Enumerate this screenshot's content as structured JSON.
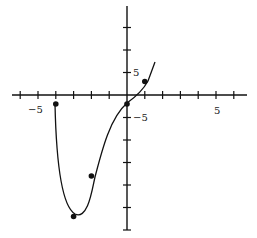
{
  "chart_data": {
    "type": "line",
    "title": "",
    "xlabel": "",
    "ylabel": "",
    "function_guess": "f(x) = x^4 + 4x^3 - 2",
    "x_ticks": [
      -6,
      -5,
      -4,
      -3,
      -2,
      -1,
      0,
      1,
      2,
      3,
      4,
      5,
      6
    ],
    "x_tick_labels": [
      {
        "value": -5,
        "label": "−5"
      },
      {
        "value": 5,
        "label": "5"
      }
    ],
    "y_ticks": [
      -30,
      -25,
      -20,
      -15,
      -10,
      -5,
      0,
      5,
      10,
      15
    ],
    "y_tick_labels": [
      {
        "value": 5,
        "label": "5"
      },
      {
        "value": -5,
        "label": "−5"
      }
    ],
    "xlim": [
      -6.5,
      6.5
    ],
    "ylim": [
      -30,
      18
    ],
    "grid": false,
    "series": [
      {
        "name": "f(x)",
        "x": [
          -4,
          -3.5,
          -3,
          -2.5,
          -2,
          -1.5,
          -1,
          -0.5,
          0,
          0.5,
          1,
          1.3
        ],
        "values": [
          -2,
          -16,
          -27,
          -25,
          -18,
          -11,
          -5,
          -2.5,
          -2,
          -1,
          3,
          7
        ]
      }
    ],
    "marked_points": [
      {
        "x": -4,
        "y": -2
      },
      {
        "x": -3,
        "y": -27
      },
      {
        "x": -2,
        "y": -18
      },
      {
        "x": 0,
        "y": -2
      },
      {
        "x": 1,
        "y": 3
      }
    ]
  },
  "labels": {
    "x_neg5": "−5",
    "x_pos5": "5",
    "y_pos5": "5",
    "y_neg5": "−5"
  }
}
